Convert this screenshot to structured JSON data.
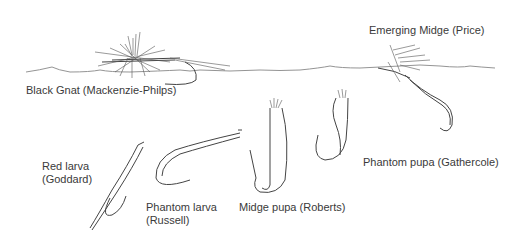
{
  "illustration": {
    "subject": "Fly patterns at and below the water surface",
    "labels": [
      {
        "id": "black-gnat",
        "text": "Black Gnat (Mackenzie-Philps)"
      },
      {
        "id": "emerging-midge",
        "text": "Emerging Midge (Price)"
      },
      {
        "id": "red-larva-1",
        "text": "Red larva"
      },
      {
        "id": "red-larva-2",
        "text": "(Goddard)"
      },
      {
        "id": "phantom-larva-1",
        "text": "Phantom larva"
      },
      {
        "id": "phantom-larva-2",
        "text": "(Russell)"
      },
      {
        "id": "midge-pupa",
        "text": "Midge pupa (Roberts)"
      },
      {
        "id": "phantom-pupa",
        "text": "Phantom pupa (Gathercole)"
      }
    ]
  }
}
